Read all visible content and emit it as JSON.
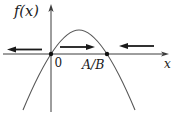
{
  "figure": {
    "background_color": "#ffffff",
    "axis_color": "#3d3d3d",
    "curve_color": "#565656",
    "arrow_color": "#1a1a1a",
    "point_color": "#111111",
    "text_color": "#1a1a1a",
    "y_axis_label": "f(x)",
    "x_axis_label": "x",
    "equilibrium_points": [
      {
        "label": "0"
      },
      {
        "label": "A/B"
      }
    ],
    "curve": {
      "type": "downward-parabola",
      "roots": [
        "0",
        "A/B"
      ]
    },
    "flow_arrows": [
      {
        "region": "left-of-0",
        "direction": "left"
      },
      {
        "region": "between-0-and-A/B",
        "direction": "right"
      },
      {
        "region": "right-of-A/B",
        "direction": "left"
      }
    ]
  }
}
